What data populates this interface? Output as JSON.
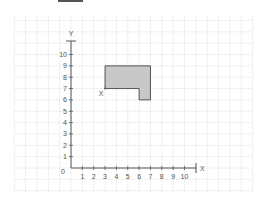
{
  "diagram": {
    "type": "coordinate-grid",
    "origin_label": "0",
    "x_axis": {
      "label": "X",
      "ticks": [
        "1",
        "2",
        "3",
        "4",
        "5",
        "6",
        "7",
        "8",
        "9",
        "10"
      ]
    },
    "y_axis": {
      "label": "Y",
      "ticks": [
        "1",
        "2",
        "3",
        "4",
        "5",
        "6",
        "7",
        "8",
        "9",
        "10"
      ]
    },
    "shape": {
      "fill": "#c8c8c8",
      "stroke": "#555555",
      "vertices": [
        [
          3,
          9
        ],
        [
          7,
          9
        ],
        [
          7,
          6
        ],
        [
          6,
          6
        ],
        [
          6,
          7
        ],
        [
          3,
          7
        ]
      ]
    },
    "point": {
      "label": "X",
      "x": 3,
      "y": 7
    },
    "colors": {
      "grid": "#d8d8d8",
      "axis": "#555555",
      "text": "#555555"
    }
  }
}
